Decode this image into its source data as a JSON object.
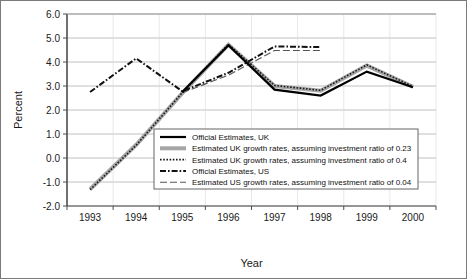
{
  "chart_data": {
    "type": "line",
    "title": "",
    "xlabel": "Year",
    "ylabel": "Percent",
    "categories": [
      "1993",
      "1994",
      "1995",
      "1996",
      "1997",
      "1998",
      "1999",
      "2000"
    ],
    "ylim": [
      -2.0,
      6.0
    ],
    "ytick_labels": [
      "6.0",
      "5.0",
      "4.0",
      "3.0",
      "2.0",
      "1.0",
      "0.0",
      "-1.0",
      "-2.0"
    ],
    "ytick_values": [
      6.0,
      5.0,
      4.0,
      3.0,
      2.0,
      1.0,
      0.0,
      -1.0,
      -2.0
    ],
    "grid": true,
    "legend_position": "center",
    "series": [
      {
        "name": "Official Estimates, UK",
        "style": "solid-black",
        "color": "#000000",
        "values": [
          null,
          null,
          2.75,
          4.7,
          2.85,
          2.6,
          3.6,
          2.95
        ]
      },
      {
        "name": "Estimated UK growth rates, assuming investment ratio of 0.23",
        "style": "thick-gray",
        "color": "#a6a6a6",
        "values": [
          -1.3,
          0.55,
          2.7,
          4.72,
          3.0,
          2.8,
          3.85,
          2.97
        ]
      },
      {
        "name": "Estimated UK growth rates, assuming investment ratio of 0.4",
        "style": "fine-dotted",
        "color": "#1a1a1a",
        "values": [
          -1.32,
          0.53,
          2.72,
          4.74,
          3.02,
          2.82,
          3.88,
          2.98
        ]
      },
      {
        "name": "Official Estimates, US",
        "style": "dash-dot",
        "color": "#111111",
        "values": [
          2.75,
          4.15,
          2.78,
          3.55,
          4.65,
          4.62,
          null,
          null
        ]
      },
      {
        "name": "Estimated US growth rates, assuming investment ratio of 0.04",
        "style": "long-dash",
        "color": "#555555",
        "values": [
          null,
          null,
          2.72,
          3.45,
          4.48,
          4.48,
          null,
          null
        ]
      }
    ]
  },
  "legend": {
    "items": [
      {
        "label": "Official Estimates, UK",
        "swatch": "solid-black"
      },
      {
        "label": "Estimated UK growth rates, assuming investment ratio of 0.23",
        "swatch": "thick-gray"
      },
      {
        "label": "Estimated UK growth rates, assuming investment ratio of 0.4",
        "swatch": "fine-dotted"
      },
      {
        "label": "Official Estimates, US",
        "swatch": "dash-dot"
      },
      {
        "label": "Estimated US growth rates, assuming investment ratio of 0.04",
        "swatch": "long-dash"
      }
    ]
  },
  "colors": {
    "grid": "#b0b0b0",
    "axis": "#4d4d4d",
    "frame": "#7a7a7a",
    "background": "#ffffff"
  }
}
